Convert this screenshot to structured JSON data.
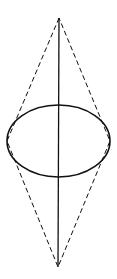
{
  "diagram": {
    "type": "geometric-figure",
    "canvas": {
      "width": 117,
      "height": 279,
      "background": "#ffffff"
    },
    "stroke_color": "#111111",
    "ellipse": {
      "cx": 58.5,
      "cy": 141,
      "rx": 51.5,
      "ry": 36,
      "stroke_width": 1.6
    },
    "axis": {
      "x1": 59,
      "y1": 18,
      "x2": 58,
      "y2": 267,
      "stroke_width": 1.3
    },
    "dashed_outline": {
      "points": [
        [
          59,
          18
        ],
        [
          7,
          141
        ],
        [
          58,
          267
        ],
        [
          110,
          141
        ]
      ],
      "dash": "5,3",
      "stroke_width": 1
    }
  }
}
